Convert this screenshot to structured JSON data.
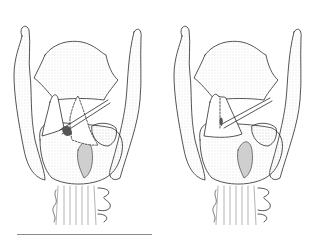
{
  "figure": {
    "panels": [
      {
        "id": "left",
        "label": "",
        "variant": "arytenoid with dashed repositioned outline and instrument, triangle displaced"
      },
      {
        "id": "right",
        "label": "",
        "variant": "arytenoid repositioned with instrument, dashed midline"
      }
    ],
    "colors": {
      "ink": "#2a2a2a",
      "shade": "#bdbdbd",
      "background": "#ffffff",
      "rule": "#8a8a8a"
    }
  }
}
